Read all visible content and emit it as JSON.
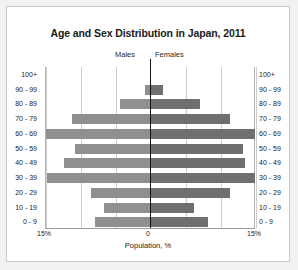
{
  "chart_data": {
    "type": "bar",
    "subtype": "population-pyramid",
    "title": "Age and Sex Distribution in Japan, 2011",
    "xlabel": "Population, %",
    "ylabel": "",
    "xlim": [
      -15,
      15
    ],
    "xtick_labels": [
      "15%",
      "0",
      "15%"
    ],
    "grid": true,
    "legend_position": "above-axis-center",
    "categories": [
      "100+",
      "90 - 99",
      "80 - 89",
      "70 - 79",
      "60 - 69",
      "50 - 59",
      "40 - 49",
      "30 - 39",
      "20 - 29",
      "10 - 19",
      "0 - 9"
    ],
    "series": [
      {
        "name": "Males",
        "side": "left",
        "color": "#8f8f8f",
        "values": [
          0.0,
          0.9,
          4.4,
          11.3,
          15.0,
          10.9,
          12.5,
          14.9,
          8.6,
          6.7,
          8.0
        ]
      },
      {
        "name": "Females",
        "side": "right",
        "color": "#6f6f6f",
        "values": [
          0.0,
          1.7,
          7.0,
          11.3,
          14.9,
          13.1,
          13.4,
          14.9,
          11.3,
          6.2,
          8.2
        ]
      }
    ]
  },
  "chart": {
    "title": "Age and Sex Distribution in Japan, 2011",
    "legend": {
      "males": "Males",
      "females": "Females"
    },
    "axis": {
      "x_title": "Population, %",
      "tick_left": "15%",
      "tick_zero": "0",
      "tick_right": "15%"
    },
    "age_groups": [
      "100+",
      "90 - 99",
      "80 - 89",
      "70 - 79",
      "60 - 69",
      "50 - 59",
      "40 - 49",
      "30 - 39",
      "20 - 29",
      "10 - 19",
      "0 - 9"
    ],
    "colors": {
      "male_bar": "#8f8f8f",
      "female_bar": "#6f6f6f",
      "zero_line": "#111111",
      "gridline": "#cdcdcd",
      "page_background": "#f2f2f2",
      "figure_background": "#ffffff"
    }
  }
}
